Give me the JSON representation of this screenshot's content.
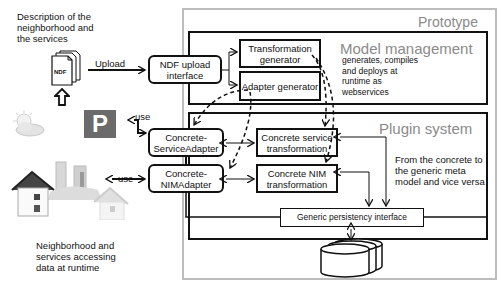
{
  "left": {
    "description": "Description of the neighborhood and the services",
    "file_label": "NDF",
    "upload_label": "Upload",
    "use_label_1": "use",
    "use_label_2": "use",
    "bottom_caption": "Neighborhood and services accessing data at runtime",
    "icons": [
      "document-stack-icon",
      "up-arrow-icon",
      "weather-icon",
      "parking-icon",
      "houses-icon"
    ]
  },
  "prototype": {
    "title": "Prototype",
    "ndf_upload": "NDF upload interface",
    "model_management": {
      "title": "Model management",
      "note": "generates, compiles and deploys at runtime as webservices",
      "transformation_generator": "Transformation generator",
      "adapter_generator": "Adapter generator"
    },
    "plugin_system": {
      "title": "Plugin system",
      "service_adapter": "Concrete-ServiceAdapter",
      "nim_adapter": "Concrete-NIMAdapter",
      "service_transformation": "Concrete service transformation",
      "nim_transformation": "Concrete NIM transformation",
      "note": "From the concrete to the generic meta model and vice versa"
    },
    "persistency": "Generic persistency interface"
  },
  "colors": {
    "line": "#111111",
    "outer_border": "#bdbdbd",
    "gray_text": "#8a8a8a",
    "parking_bg": "#6b6b6b"
  }
}
